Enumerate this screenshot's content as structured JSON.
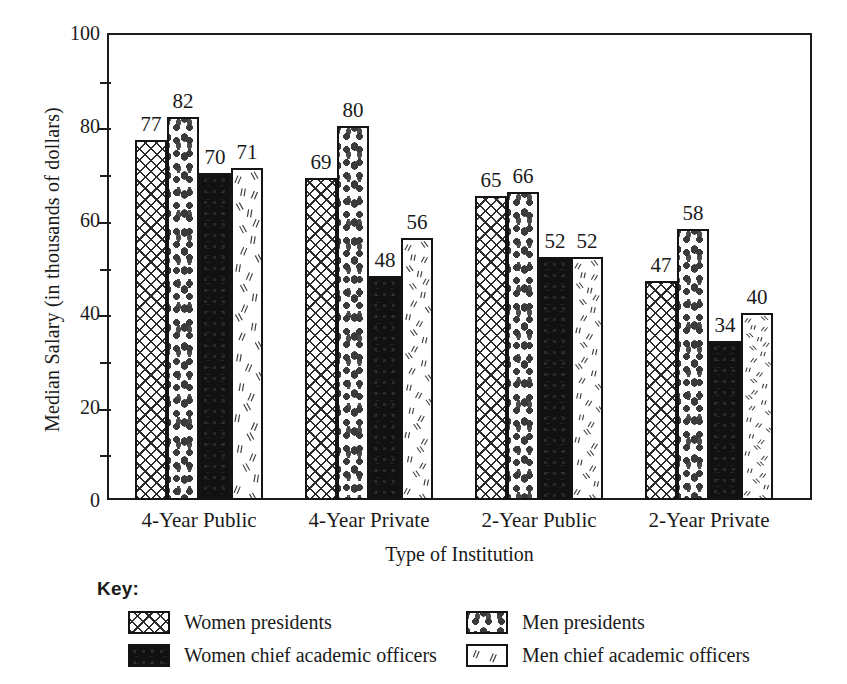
{
  "chart_data": {
    "type": "bar",
    "title": "",
    "xlabel": "Type of Institution",
    "ylabel": "Median Salary (in thousands of dollars)",
    "ylim": [
      0,
      100
    ],
    "ytick_labels": [
      "0",
      "20",
      "40",
      "60",
      "80",
      "100"
    ],
    "ytick_values": [
      0,
      20,
      40,
      60,
      80,
      100
    ],
    "minor_tick_values": [
      10,
      30,
      50,
      70,
      90
    ],
    "grid": false,
    "legend_position": "below-plot",
    "legend_title": "Key:",
    "categories": [
      "4-Year Public",
      "4-Year Private",
      "2-Year Public",
      "2-Year Private"
    ],
    "series": [
      {
        "name": "Women presidents",
        "pattern": "crosshatch",
        "values": [
          77,
          69,
          65,
          47
        ]
      },
      {
        "name": "Men presidents",
        "pattern": "dots",
        "values": [
          82,
          80,
          66,
          58
        ]
      },
      {
        "name": "Women chief academic officers",
        "pattern": "solid",
        "values": [
          70,
          48,
          52,
          34
        ]
      },
      {
        "name": "Men chief academic officers",
        "pattern": "slashes",
        "values": [
          71,
          56,
          52,
          40
        ]
      }
    ],
    "colors": {
      "axis": "#1c1c1c",
      "bar_outline": "#141414",
      "solid_fill": "#111111",
      "background": "#ffffff"
    }
  }
}
